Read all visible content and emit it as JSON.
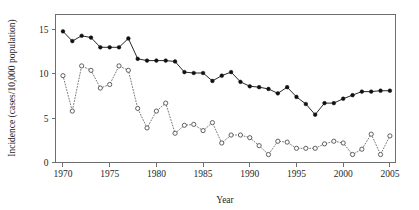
{
  "chart_data": {
    "type": "line",
    "title": "",
    "subtitle": "",
    "xlabel": "Year",
    "ylabel": "Incidence (cases/10,000 population)",
    "xlim": [
      1969.2,
      2005.6
    ],
    "ylim": [
      0,
      16.7
    ],
    "xticks": [
      1970,
      1975,
      1980,
      1985,
      1990,
      1995,
      2000,
      2005
    ],
    "xtick_labels": [
      "1970",
      "1975",
      "1980",
      "1985",
      "1990",
      "1995",
      "2000",
      "2005"
    ],
    "yticks": [
      0,
      5,
      10,
      15
    ],
    "ytick_labels": [
      "0",
      "5",
      "10",
      "15"
    ],
    "grid": false,
    "legend": "none",
    "frame": true,
    "x": [
      1970,
      1971,
      1972,
      1973,
      1974,
      1975,
      1976,
      1977,
      1978,
      1979,
      1980,
      1981,
      1982,
      1983,
      1984,
      1985,
      1986,
      1987,
      1988,
      1989,
      1990,
      1991,
      1992,
      1993,
      1994,
      1995,
      1996,
      1997,
      1998,
      1999,
      2000,
      2001,
      2002,
      2003,
      2004,
      2005
    ],
    "series": [
      {
        "name": "filled-circle-solid-series",
        "marker": "filled-circle",
        "linestyle": "solid",
        "color": "#111111",
        "values": [
          14.8,
          13.7,
          14.3,
          14.1,
          13.0,
          13.0,
          13.0,
          14.0,
          11.7,
          11.5,
          11.5,
          11.5,
          11.4,
          10.2,
          10.1,
          10.1,
          9.2,
          9.8,
          10.2,
          9.1,
          8.6,
          8.5,
          8.3,
          7.8,
          8.5,
          7.4,
          6.6,
          5.4,
          6.7,
          6.7,
          7.2,
          7.6,
          8.0,
          8.0,
          8.1,
          8.1
        ]
      },
      {
        "name": "open-circle-dotted-series",
        "marker": "open-circle",
        "linestyle": "dotted",
        "color": "#6a6a6a",
        "values": [
          9.8,
          5.8,
          10.9,
          10.4,
          8.4,
          8.8,
          10.9,
          10.4,
          6.1,
          3.9,
          5.8,
          6.7,
          3.3,
          4.2,
          4.3,
          3.6,
          4.5,
          2.2,
          3.1,
          3.1,
          2.8,
          1.9,
          0.9,
          2.4,
          2.3,
          1.6,
          1.6,
          1.6,
          2.1,
          2.4,
          2.2,
          0.9,
          1.5,
          3.2,
          0.9,
          3.0
        ]
      }
    ]
  }
}
